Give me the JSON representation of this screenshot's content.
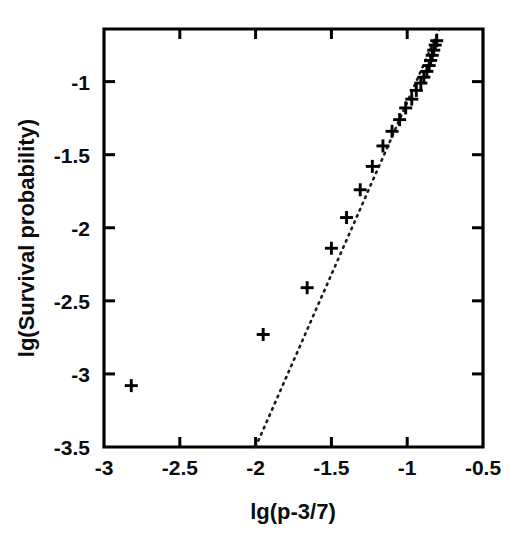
{
  "figure": {
    "background_color": "#ffffff",
    "ink_color": "#000000",
    "width": 528,
    "height": 548
  },
  "chart_data": {
    "type": "scatter",
    "title": "",
    "xlabel": "lg(p-3/7)",
    "ylabel": "lg(Survival probability)",
    "xlim": [
      -3.0,
      -0.5
    ],
    "ylim": [
      -3.5,
      -0.64
    ],
    "xticks": [
      -3,
      -2.5,
      -2,
      -1.5,
      -1,
      -0.5
    ],
    "xticklabels": [
      "-3",
      "-2.5",
      "-2",
      "-1.5",
      "-1",
      "-0.5"
    ],
    "yticks": [
      -1,
      -1.5,
      -2,
      -2.5,
      -3,
      -3.5
    ],
    "yticklabels": [
      "-1",
      "-1.5",
      "-2",
      "-2.5",
      "-3",
      "-3.5"
    ],
    "grid": false,
    "legend": null,
    "marker": "plus",
    "marker_size": 13,
    "series": [
      {
        "name": "Survival probability data",
        "marker": "plus",
        "x": [
          -2.82,
          -1.95,
          -1.66,
          -1.5,
          -1.4,
          -1.31,
          -1.23,
          -1.16,
          -1.1,
          -1.05,
          -1.01,
          -0.97,
          -0.94,
          -0.91,
          -0.89,
          -0.87,
          -0.855,
          -0.845,
          -0.835,
          -0.825,
          -0.815,
          -0.805
        ],
        "y": [
          -3.08,
          -2.73,
          -2.41,
          -2.14,
          -1.93,
          -1.74,
          -1.58,
          -1.44,
          -1.34,
          -1.26,
          -1.18,
          -1.12,
          -1.06,
          -1.01,
          -0.97,
          -0.93,
          -0.89,
          -0.855,
          -0.82,
          -0.785,
          -0.75,
          -0.72
        ]
      }
    ],
    "fit_line": {
      "name": "power-law fit",
      "style": "dotted",
      "x": [
        -2.0,
        -0.79
      ],
      "y": [
        -3.5,
        -0.645
      ],
      "slope": 2.36,
      "intercept": 1.22
    }
  }
}
